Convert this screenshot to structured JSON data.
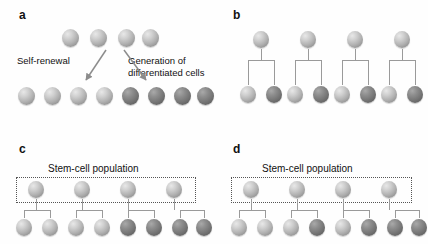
{
  "figure": {
    "type": "diagram",
    "background": "#ffffff",
    "colors": {
      "cell_light": "#c0c0c0",
      "cell_dark": "#7a7a7a",
      "connector": "#8a8a8a",
      "arrow": "#808080",
      "dotted_box": "#555555",
      "text": "#111111"
    }
  },
  "panels": [
    {
      "id": "a",
      "label": "a",
      "annotations": [
        {
          "name": "self-renewal-label",
          "text": "Self-renewal"
        },
        {
          "name": "differentiation-label-line1",
          "text": "Generation of"
        },
        {
          "name": "differentiation-label-line2",
          "text": "differentiated cells"
        }
      ],
      "top_row": {
        "count": 4,
        "types": [
          "light",
          "light",
          "light",
          "light"
        ]
      },
      "bottom_row": {
        "count": 8,
        "types": [
          "light",
          "light",
          "light",
          "light",
          "dark",
          "dark",
          "dark",
          "dark"
        ]
      },
      "arrows": [
        {
          "name": "self-renewal-arrow",
          "direction": "down-left"
        },
        {
          "name": "differentiation-arrow",
          "direction": "down-right"
        }
      ]
    },
    {
      "id": "b",
      "label": "b",
      "units": [
        {
          "parent": "light",
          "children": [
            "light",
            "dark"
          ]
        },
        {
          "parent": "light",
          "children": [
            "light",
            "dark"
          ]
        },
        {
          "parent": "light",
          "children": [
            "light",
            "dark"
          ]
        },
        {
          "parent": "light",
          "children": [
            "light",
            "dark"
          ]
        }
      ]
    },
    {
      "id": "c",
      "label": "c",
      "population_label": "Stem-cell population",
      "stem_row": {
        "count": 4,
        "types": [
          "light",
          "light",
          "light",
          "light"
        ]
      },
      "units": [
        {
          "children": [
            "light",
            "light"
          ]
        },
        {
          "children": [
            "light",
            "light"
          ]
        },
        {
          "children": [
            "dark",
            "dark"
          ]
        },
        {
          "children": [
            "dark",
            "dark"
          ]
        }
      ]
    },
    {
      "id": "d",
      "label": "d",
      "population_label": "Stem-cell population",
      "stem_row": {
        "count": 4,
        "types": [
          "light",
          "light",
          "light",
          "light"
        ]
      },
      "units": [
        {
          "children": [
            "light",
            "light"
          ]
        },
        {
          "children": [
            "light",
            "dark"
          ]
        },
        {
          "children": [
            "light",
            "dark"
          ]
        },
        {
          "children": [
            "dark",
            "dark"
          ]
        }
      ]
    }
  ]
}
